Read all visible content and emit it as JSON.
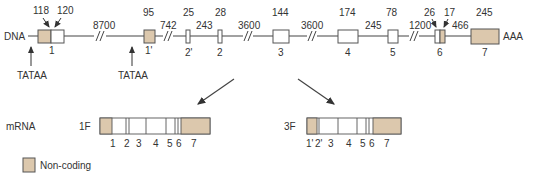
{
  "colors": {
    "noncoding": "#dcc8ad",
    "line": "#444444",
    "box_stroke": "#555555"
  },
  "dna": {
    "label": "DNA",
    "tail_label": "AAA",
    "promoters": [
      {
        "label": "TATAA"
      },
      {
        "label": "TATAA"
      }
    ],
    "exons": [
      {
        "id": "1",
        "label": "1",
        "size_noncoding": "118",
        "size_coding": "120"
      },
      {
        "id": "1p",
        "label": "1'",
        "size": "95"
      },
      {
        "id": "2p",
        "label": "2'",
        "size": "25"
      },
      {
        "id": "2",
        "label": "2",
        "size": "28"
      },
      {
        "id": "3",
        "label": "3",
        "size": "144"
      },
      {
        "id": "4",
        "label": "4",
        "size": "174"
      },
      {
        "id": "5",
        "label": "5",
        "size": "78"
      },
      {
        "id": "6",
        "label": "6",
        "size_coding": "26",
        "size_noncoding": "17"
      },
      {
        "id": "7",
        "label": "7",
        "size": "245"
      }
    ],
    "introns": [
      "8700",
      "742",
      "243",
      "3600",
      "3600",
      "245",
      "1200",
      "466"
    ]
  },
  "mrna": {
    "label": "mRNA",
    "isoforms": [
      {
        "name": "1F",
        "exon_labels": [
          "1",
          "2",
          "3",
          "4",
          "5",
          "6",
          "7"
        ]
      },
      {
        "name": "3F",
        "exon_labels": [
          "1'",
          "2'",
          "3",
          "4",
          "5",
          "6",
          "7"
        ]
      }
    ]
  },
  "legend": {
    "label": "Non-coding"
  }
}
